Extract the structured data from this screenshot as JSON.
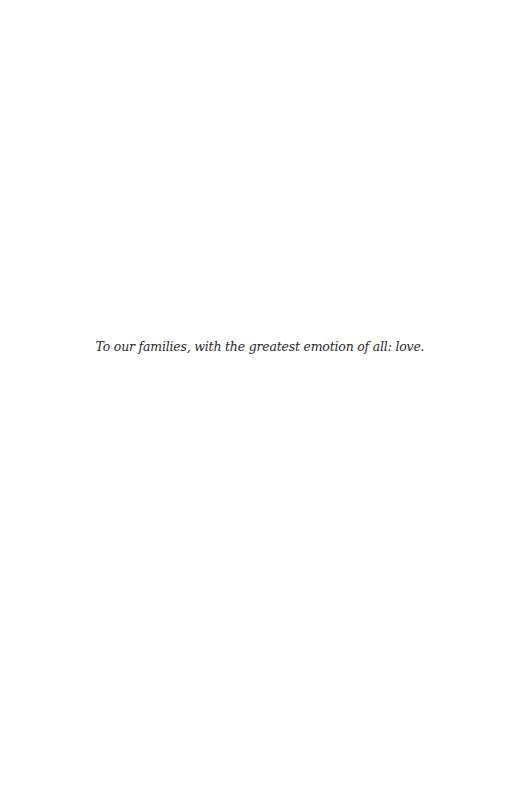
{
  "page": {
    "dedication": "To our families, with the greatest emotion of all: love."
  }
}
